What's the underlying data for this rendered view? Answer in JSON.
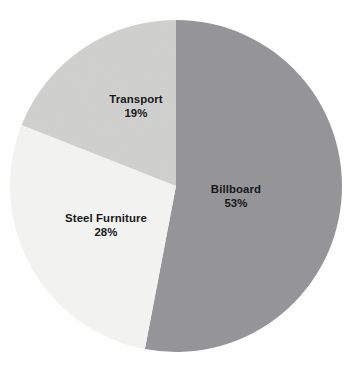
{
  "figure": {
    "background_color": "#ffffff",
    "label_text_color": "#17181a"
  },
  "chart_data": {
    "type": "pie",
    "title": "",
    "subtitle": "",
    "xlabel": "",
    "ylabel": "",
    "legend_position": "none",
    "grid": false,
    "labels_inside_slices": true,
    "start_angle_deg": 0,
    "direction": "clockwise",
    "center": {
      "x": 176,
      "y": 186
    },
    "radius": 166,
    "categories": [
      "Billboard",
      "Steel Furniture",
      "Transport"
    ],
    "values": [
      53,
      28,
      19
    ],
    "value_unit": "%",
    "colors": [
      "#7f8083",
      "#f0f1ef",
      "#c6c7c5"
    ],
    "slices": [
      {
        "name": "Billboard",
        "value": 53,
        "value_label": "53%",
        "color": "#7f8083",
        "start_angle_deg": 0,
        "end_angle_deg": 190.8
      },
      {
        "name": "Steel Furniture",
        "value": 28,
        "value_label": "28%",
        "color": "#f0f1ef",
        "start_angle_deg": 190.8,
        "end_angle_deg": 291.6
      },
      {
        "name": "Transport",
        "value": 19,
        "value_label": "19%",
        "color": "#c6c7c5",
        "start_angle_deg": 291.6,
        "end_angle_deg": 360
      }
    ]
  }
}
